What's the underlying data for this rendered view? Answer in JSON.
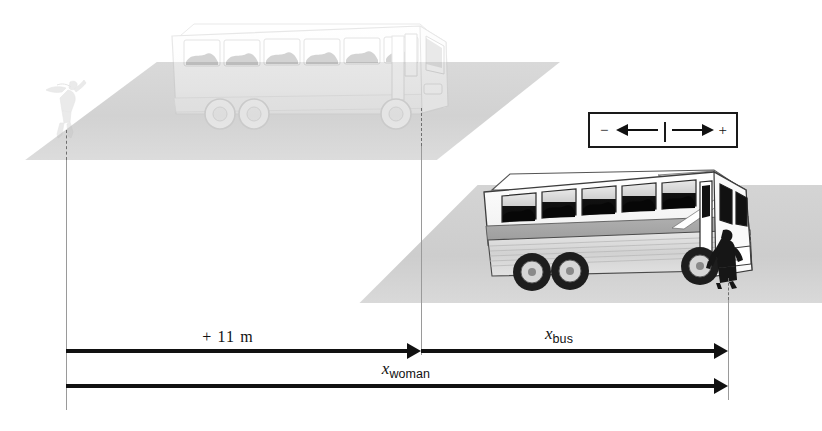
{
  "figure": {
    "background_color": "#ffffff",
    "width": 822,
    "height": 431
  },
  "scene": {
    "ground_color": "#d4d4d4",
    "initial_bus": {
      "name": "bus-initial-position",
      "style": "ghosted",
      "opacity": "0.40",
      "body_color": "#ffffff",
      "window_color": "#8e8e8e"
    },
    "final_bus": {
      "name": "bus-final-position",
      "style": "solid",
      "body_color": "#f2f2f2",
      "stripe_color": "#9a9a9a",
      "window_color": "#1a1a1a"
    },
    "running_woman": {
      "name": "woman-running",
      "style": "ghosted",
      "color": "#bcbcbc"
    },
    "boarding_woman": {
      "name": "woman-boarding",
      "style": "solid",
      "color": "#1c1c1c"
    }
  },
  "reference_lines": [
    {
      "name": "origin-line",
      "x": 66,
      "label": "start position of woman"
    },
    {
      "name": "bus-start-line",
      "x": 421,
      "label": "initial position of bus door"
    },
    {
      "name": "bus-end-line",
      "x": 728,
      "label": "final position of bus door"
    }
  ],
  "measurements": [
    {
      "name": "distance-woman-to-bus",
      "label_text": "+ 11 m",
      "label_kind": "plain",
      "value": 11,
      "unit": "m",
      "sign": "+",
      "from_x": 66,
      "to_x": 421,
      "arrow_y": 351,
      "label_x": 228,
      "label_y": 329,
      "direction": "right"
    },
    {
      "name": "displacement-bus",
      "label_variable": "x",
      "label_subscript": "bus",
      "label_kind": "variable",
      "from_x": 421,
      "to_x": 728,
      "arrow_y": 351,
      "label_x": 559,
      "label_y": 325,
      "direction": "right"
    },
    {
      "name": "displacement-woman",
      "label_variable": "x",
      "label_subscript": "woman",
      "label_kind": "variable",
      "from_x": 66,
      "to_x": 728,
      "arrow_y": 386,
      "label_x": 406,
      "label_y": 360,
      "direction": "right"
    }
  ],
  "legend": {
    "name": "sign-convention-legend",
    "negative_sign": "−",
    "positive_sign": "+",
    "left_arrow_icon": "left-arrow-icon",
    "right_arrow_icon": "right-arrow-icon",
    "divider_icon": "origin-tick-icon",
    "border_color": "#1a1a1a",
    "x": 588,
    "y": 112,
    "width": 150,
    "height": 36
  }
}
